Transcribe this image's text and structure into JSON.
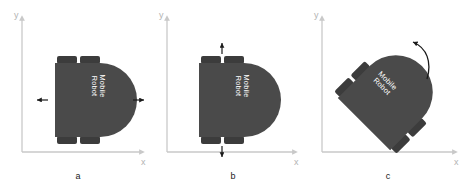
{
  "figure": {
    "background_color": "#ffffff",
    "panel_count": 3
  },
  "style": {
    "body_color": "#4a4a4a",
    "wheel_color": "#3c3c3c",
    "axis_color": "#c9c9c9",
    "axis_label_color": "#b3b3b3",
    "arrow_color": "#1a1a1a",
    "label_text_color": "#ffffff",
    "caption_color": "#1a1a1a"
  },
  "axes": {
    "x_label": "x",
    "y_label": "y"
  },
  "robot": {
    "label_line1": "Mobile",
    "label_line2": "Robot",
    "wheel_count": 4,
    "shape": "d-shape-dome-right"
  },
  "panels": [
    {
      "id": "a",
      "caption": "a",
      "motion": "lateral-translation",
      "rotation_deg": 0,
      "arrows": [
        {
          "name": "arrow-left",
          "direction": "left"
        },
        {
          "name": "arrow-right",
          "direction": "right"
        }
      ]
    },
    {
      "id": "b",
      "caption": "b",
      "motion": "longitudinal-translation",
      "rotation_deg": 0,
      "arrows": [
        {
          "name": "arrow-up",
          "direction": "up"
        },
        {
          "name": "arrow-down",
          "direction": "down"
        }
      ]
    },
    {
      "id": "c",
      "caption": "c",
      "motion": "rotation",
      "rotation_deg": -45,
      "arrows": [
        {
          "name": "arrow-rotate-ccw",
          "direction": "counterclockwise-arc"
        }
      ]
    }
  ]
}
